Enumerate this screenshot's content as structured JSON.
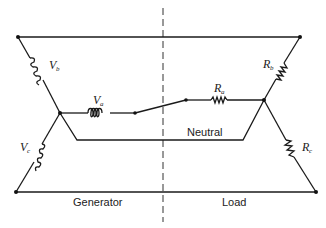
{
  "diagram": {
    "type": "three-phase wye circuit with neutral",
    "labels": {
      "generator": "Generator",
      "load": "Load",
      "neutral": "Neutral"
    },
    "sources": [
      {
        "symbol": "V",
        "subscript": "a",
        "kind": "inductor-coil"
      },
      {
        "symbol": "V",
        "subscript": "b",
        "kind": "inductor-coil"
      },
      {
        "symbol": "V",
        "subscript": "c",
        "kind": "inductor-coil"
      }
    ],
    "loads": [
      {
        "symbol": "R",
        "subscript": "a",
        "kind": "resistor"
      },
      {
        "symbol": "R",
        "subscript": "b",
        "kind": "resistor"
      },
      {
        "symbol": "R",
        "subscript": "c",
        "kind": "resistor"
      }
    ],
    "switch": {
      "state": "open",
      "location": "phase a line"
    },
    "divider": "dashed vertical line separating generator and load"
  }
}
